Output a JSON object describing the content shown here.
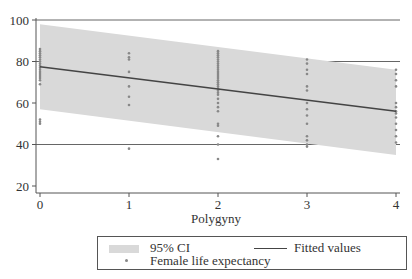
{
  "chart_data": {
    "type": "scatter",
    "title": "",
    "xlabel": "Polygyny",
    "ylabel": "",
    "xlim": [
      0,
      4
    ],
    "ylim": [
      18,
      100
    ],
    "x_ticks": [
      "0",
      "1",
      "2",
      "3",
      "4"
    ],
    "y_ticks": [
      "20",
      "40",
      "60",
      "80",
      "100"
    ],
    "grid": {
      "horizontal": true,
      "lines_at": [
        100,
        80,
        40
      ]
    },
    "legend_position": "bottom",
    "series": [
      {
        "name": "95% CI",
        "kind": "band",
        "color": "#d9d9d9",
        "x": [
          0,
          4
        ],
        "lower": [
          57,
          35
        ],
        "upper": [
          98,
          76
        ]
      },
      {
        "name": "Fitted values",
        "kind": "line",
        "color": "#444444",
        "x": [
          0,
          4
        ],
        "y": [
          77.5,
          56
        ]
      },
      {
        "name": "Female life expectancy",
        "kind": "scatter",
        "color": "#888888",
        "points": [
          {
            "x": 0,
            "y": [
              86,
              85,
              84,
              83,
              82,
              81,
              80,
              79,
              78,
              77,
              76,
              75,
              74,
              73,
              72,
              71,
              69,
              52,
              51,
              50
            ]
          },
          {
            "x": 1,
            "y": [
              84,
              82,
              81,
              75,
              68,
              63,
              59,
              38
            ]
          },
          {
            "x": 2,
            "y": [
              85,
              84,
              83,
              82,
              81,
              80,
              79,
              78,
              77,
              76,
              75,
              74,
              73,
              72,
              71,
              70,
              69,
              68,
              67,
              66,
              65,
              64,
              62,
              60,
              58,
              56,
              50,
              49,
              44,
              40,
              33
            ]
          },
          {
            "x": 3,
            "y": [
              81,
              79,
              76,
              74,
              68,
              66,
              60,
              57,
              54,
              50,
              44,
              42,
              40,
              39
            ]
          },
          {
            "x": 4,
            "y": [
              76,
              74,
              71,
              68,
              60,
              58,
              56,
              55,
              53,
              50,
              47,
              44,
              41
            ]
          }
        ]
      }
    ]
  },
  "legend": {
    "ci_label": "95% CI",
    "fitted_label": "Fitted values",
    "points_label": "Female life expectancy"
  },
  "axes": {
    "x_title": "Polygyny",
    "x_ticks": [
      "0",
      "1",
      "2",
      "3",
      "4"
    ],
    "y_ticks": [
      "100",
      "80",
      "60",
      "40",
      "20"
    ]
  }
}
